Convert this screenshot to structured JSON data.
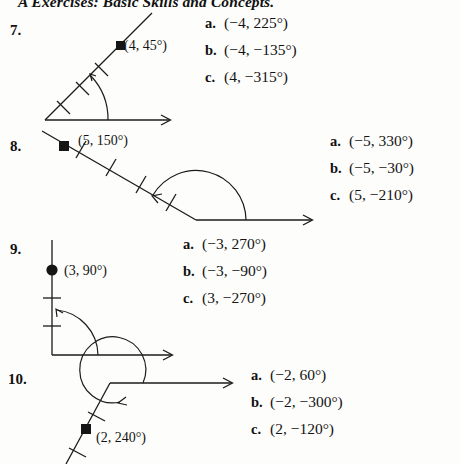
{
  "page": {
    "header": "A Exercises: Basic Skills and Concepts.",
    "width": 460,
    "height": 464,
    "ink_color": "#1b1b1b",
    "paper_color": "#fdfdfb"
  },
  "problems": [
    {
      "number": "7.",
      "point_label": "(4, 45°)",
      "angle_degrees": 45,
      "radius_units": 4,
      "answers": [
        {
          "letter": "a.",
          "value": "(−4, 225°)"
        },
        {
          "letter": "b.",
          "value": "(−4, −135°)"
        },
        {
          "letter": "c.",
          "value": "(4, −315°)"
        }
      ]
    },
    {
      "number": "8.",
      "point_label": "(5, 150°)",
      "angle_degrees": 150,
      "radius_units": 5,
      "answers": [
        {
          "letter": "a.",
          "value": "(−5, 330°)"
        },
        {
          "letter": "b.",
          "value": "(−5, −30°)"
        },
        {
          "letter": "c.",
          "value": "(5, −210°)"
        }
      ]
    },
    {
      "number": "9.",
      "point_label": "(3, 90°)",
      "angle_degrees": 90,
      "radius_units": 3,
      "answers": [
        {
          "letter": "a.",
          "value": "(−3, 270°)"
        },
        {
          "letter": "b.",
          "value": "(−3, −90°)"
        },
        {
          "letter": "c.",
          "value": "(3, −270°)"
        }
      ]
    },
    {
      "number": "10.",
      "point_label": "(2, 240°)",
      "angle_degrees": 240,
      "radius_units": 2,
      "answers": [
        {
          "letter": "a.",
          "value": "(−2, 60°)"
        },
        {
          "letter": "b.",
          "value": "(−2, −300°)"
        },
        {
          "letter": "c.",
          "value": "(2, −120°)"
        }
      ]
    }
  ]
}
